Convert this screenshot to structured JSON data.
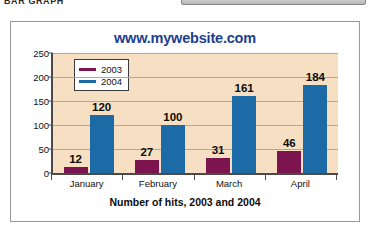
{
  "page": {
    "doc_heading": "BAR GRAPH",
    "toolbar_label": ""
  },
  "chart_data": {
    "type": "bar",
    "title": "www.mywebsite.com",
    "xlabel": "Number of hits, 2003 and 2004",
    "ylabel": "",
    "categories": [
      "January",
      "February",
      "March",
      "April"
    ],
    "series": [
      {
        "name": "2003",
        "color": "#7c1450",
        "values": [
          12,
          27,
          31,
          46
        ]
      },
      {
        "name": "2004",
        "color": "#1d6ba6",
        "values": [
          120,
          100,
          161,
          184
        ]
      }
    ],
    "ylim": [
      0,
      250
    ],
    "yticks": [
      0,
      50,
      100,
      150,
      200,
      250
    ],
    "ytick_labels": [
      "0",
      "50",
      "100",
      "150",
      "200",
      "250"
    ],
    "grid": true,
    "legend_position": "top-left",
    "plot_background": "#f6dfc2",
    "title_color": "#1d3f8f",
    "data_labels": [
      [
        "12",
        "120"
      ],
      [
        "27",
        "100"
      ],
      [
        "31",
        "161"
      ],
      [
        "46",
        "184"
      ]
    ]
  }
}
